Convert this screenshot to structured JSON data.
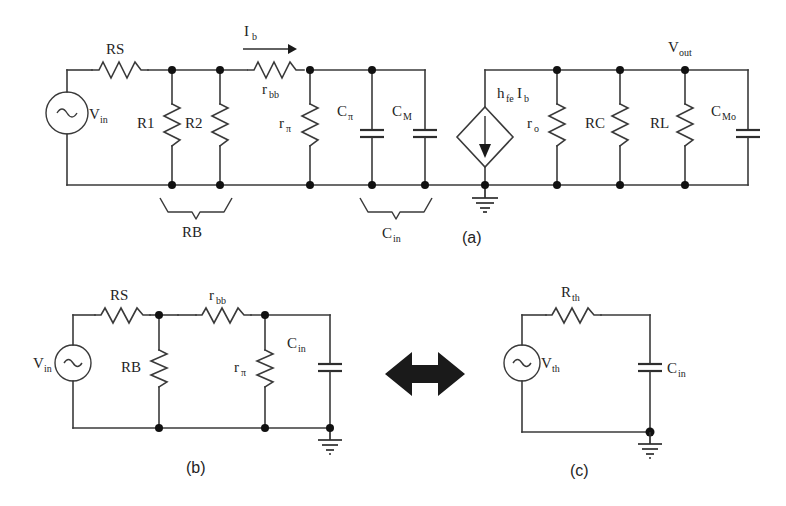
{
  "figure": {
    "background_color": "#ffffff",
    "line_color": "#3a3a3a",
    "text_color": "#242424"
  },
  "panel_labels": {
    "a": "(a)",
    "b": "(b)",
    "c": "(c)"
  },
  "circuit_a": {
    "name": "full small-signal model",
    "source": {
      "label": "V",
      "sub": "in",
      "type": "ac-source"
    },
    "current": {
      "label": "I",
      "sub": "b",
      "arrow": "right"
    },
    "output": {
      "label": "V",
      "sub": "out"
    },
    "components": [
      {
        "id": "RS",
        "label": "RS",
        "sub": "",
        "type": "resistor"
      },
      {
        "id": "R1",
        "label": "R1",
        "sub": "",
        "type": "resistor"
      },
      {
        "id": "R2",
        "label": "R2",
        "sub": "",
        "type": "resistor"
      },
      {
        "id": "rbb",
        "label": "r",
        "sub": "bb",
        "type": "resistor"
      },
      {
        "id": "rpi",
        "label": "r",
        "sub": "π",
        "type": "resistor"
      },
      {
        "id": "Cpi",
        "label": "C",
        "sub": "π",
        "type": "capacitor"
      },
      {
        "id": "CM",
        "label": "C",
        "sub": "M",
        "type": "capacitor"
      },
      {
        "id": "gm",
        "label": "h",
        "sub": "fe",
        "label2": "I",
        "sub2": "b",
        "type": "dependent-current-source"
      },
      {
        "id": "ro",
        "label": "r",
        "sub": "o",
        "type": "resistor"
      },
      {
        "id": "RC",
        "label": "RC",
        "sub": "",
        "type": "resistor"
      },
      {
        "id": "RL",
        "label": "RL",
        "sub": "",
        "type": "resistor"
      },
      {
        "id": "CMo",
        "label": "C",
        "sub": "Mo",
        "type": "capacitor"
      }
    ],
    "braces": [
      {
        "id": "RB",
        "label": "RB",
        "sub": "",
        "spans": "R1 and R2"
      },
      {
        "id": "Cin",
        "label": "C",
        "sub": "in",
        "spans": "Cpi and CM"
      }
    ],
    "ground": {
      "label": "ground",
      "count": 1
    }
  },
  "circuit_b": {
    "name": "input network",
    "source": {
      "label": "V",
      "sub": "in",
      "type": "ac-source"
    },
    "components": [
      {
        "id": "RS",
        "label": "RS",
        "sub": "",
        "type": "resistor"
      },
      {
        "id": "rbb",
        "label": "r",
        "sub": "bb",
        "type": "resistor"
      },
      {
        "id": "RB",
        "label": "RB",
        "sub": "",
        "type": "resistor"
      },
      {
        "id": "rpi",
        "label": "r",
        "sub": "π",
        "type": "resistor"
      },
      {
        "id": "Cin",
        "label": "C",
        "sub": "in",
        "type": "capacitor"
      }
    ],
    "ground": {
      "label": "ground",
      "count": 1
    }
  },
  "circuit_c": {
    "name": "thevenin equivalent",
    "source": {
      "label": "V",
      "sub": "th",
      "type": "ac-source"
    },
    "components": [
      {
        "id": "Rth",
        "label": "R",
        "sub": "th",
        "type": "resistor"
      },
      {
        "id": "Cin",
        "label": "C",
        "sub": "in",
        "type": "capacitor"
      }
    ],
    "ground": {
      "label": "ground",
      "count": 1
    }
  },
  "equivalence": {
    "symbol": "double-headed-arrow",
    "meaning": "equivalent to"
  }
}
